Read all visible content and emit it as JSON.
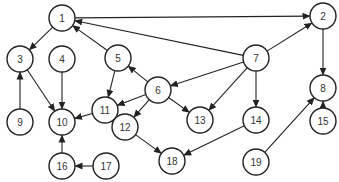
{
  "diagram": {
    "type": "directed-graph",
    "node_radius": 13,
    "colors": {
      "stroke": "#222222",
      "fill": "#ffffff",
      "text": "#333333"
    },
    "nodes": [
      {
        "id": "1",
        "label": "1",
        "x": 62,
        "y": 18
      },
      {
        "id": "2",
        "label": "2",
        "x": 323,
        "y": 16
      },
      {
        "id": "3",
        "label": "3",
        "x": 20,
        "y": 59
      },
      {
        "id": "4",
        "label": "4",
        "x": 62,
        "y": 59
      },
      {
        "id": "5",
        "label": "5",
        "x": 118,
        "y": 58
      },
      {
        "id": "6",
        "label": "6",
        "x": 158,
        "y": 90
      },
      {
        "id": "7",
        "label": "7",
        "x": 256,
        "y": 58
      },
      {
        "id": "8",
        "label": "8",
        "x": 323,
        "y": 88
      },
      {
        "id": "9",
        "label": "9",
        "x": 20,
        "y": 122
      },
      {
        "id": "10",
        "label": "10",
        "x": 62,
        "y": 122
      },
      {
        "id": "11",
        "label": "11",
        "x": 105,
        "y": 110
      },
      {
        "id": "12",
        "label": "12",
        "x": 125,
        "y": 127
      },
      {
        "id": "13",
        "label": "13",
        "x": 200,
        "y": 120
      },
      {
        "id": "14",
        "label": "14",
        "x": 256,
        "y": 120
      },
      {
        "id": "15",
        "label": "15",
        "x": 323,
        "y": 121
      },
      {
        "id": "16",
        "label": "16",
        "x": 62,
        "y": 166
      },
      {
        "id": "17",
        "label": "17",
        "x": 106,
        "y": 166
      },
      {
        "id": "18",
        "label": "18",
        "x": 172,
        "y": 161
      },
      {
        "id": "19",
        "label": "19",
        "x": 256,
        "y": 162
      }
    ],
    "edges": [
      {
        "from": "1",
        "to": "3"
      },
      {
        "from": "1",
        "to": "2"
      },
      {
        "from": "5",
        "to": "1"
      },
      {
        "from": "7",
        "to": "1"
      },
      {
        "from": "7",
        "to": "2"
      },
      {
        "from": "2",
        "to": "8"
      },
      {
        "from": "9",
        "to": "3"
      },
      {
        "from": "3",
        "to": "10"
      },
      {
        "from": "4",
        "to": "10"
      },
      {
        "from": "5",
        "to": "11"
      },
      {
        "from": "6",
        "to": "5"
      },
      {
        "from": "6",
        "to": "11"
      },
      {
        "from": "6",
        "to": "12"
      },
      {
        "from": "6",
        "to": "13"
      },
      {
        "from": "7",
        "to": "6"
      },
      {
        "from": "7",
        "to": "13"
      },
      {
        "from": "7",
        "to": "14"
      },
      {
        "from": "11",
        "to": "10"
      },
      {
        "from": "12",
        "to": "18"
      },
      {
        "from": "14",
        "to": "18"
      },
      {
        "from": "19",
        "to": "8"
      },
      {
        "from": "15",
        "to": "8"
      },
      {
        "from": "16",
        "to": "10"
      },
      {
        "from": "17",
        "to": "16"
      }
    ]
  }
}
